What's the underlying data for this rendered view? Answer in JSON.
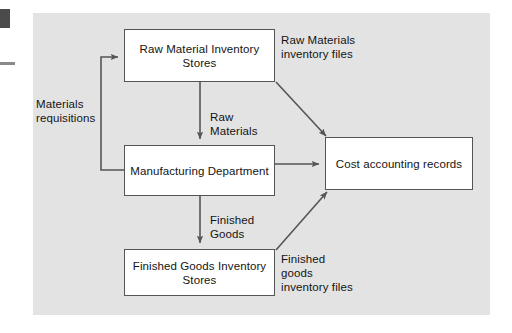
{
  "diagram": {
    "panel_color": "#e3e3e3",
    "page_background": "#ffffff",
    "node_fill": "#ffffff",
    "node_border": "#555555",
    "line_color": "#555555",
    "text_color": "#141414",
    "nodes": [
      {
        "id": "raw-material-inventory-stores",
        "label": "Raw Material\nInventory Stores"
      },
      {
        "id": "manufacturing-department",
        "label": "Manufacturing\nDepartment"
      },
      {
        "id": "finished-goods-inventory-stores",
        "label": "Finished Goods\nInventory Stores"
      },
      {
        "id": "cost-accounting-records",
        "label": "Cost\naccounting\nrecords"
      }
    ],
    "edge_labels": [
      {
        "id": "materials-requisitions",
        "label": "Materials\nrequisitions"
      },
      {
        "id": "raw-materials",
        "label": "Raw\nMaterials"
      },
      {
        "id": "finished-goods",
        "label": "Finished\nGoods"
      },
      {
        "id": "raw-materials-inventory-files",
        "label": "Raw Materials\ninventory files"
      },
      {
        "id": "finished-goods-inventory-files",
        "label": "Finished\ngoods\ninventory files"
      }
    ],
    "margin_marks": [
      {
        "id": "edge-block",
        "color": "#4b4b4b"
      },
      {
        "id": "edge-dash",
        "color": "#8a8a8a"
      }
    ]
  }
}
